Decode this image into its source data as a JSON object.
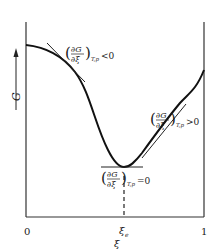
{
  "diagram": {
    "y_axis_label": "G",
    "x_axis_label": "ξ",
    "x_ticks": [
      {
        "label": "0"
      },
      {
        "label": "ξ",
        "sub": "e"
      },
      {
        "label": "1"
      }
    ],
    "annotations": {
      "left": {
        "numer": "∂G",
        "denom": "∂ξ",
        "sub": "T,p",
        "rel": "<0"
      },
      "right": {
        "numer": "∂G",
        "denom": "∂ξ",
        "sub": "T,p",
        "rel": ">0"
      },
      "bottom": {
        "numer": "∂G",
        "denom": "∂ξ",
        "sub": "T,p",
        "rel": "=0"
      }
    },
    "colors": {
      "line": "#1a1a1a",
      "background": "#ffffff"
    }
  }
}
